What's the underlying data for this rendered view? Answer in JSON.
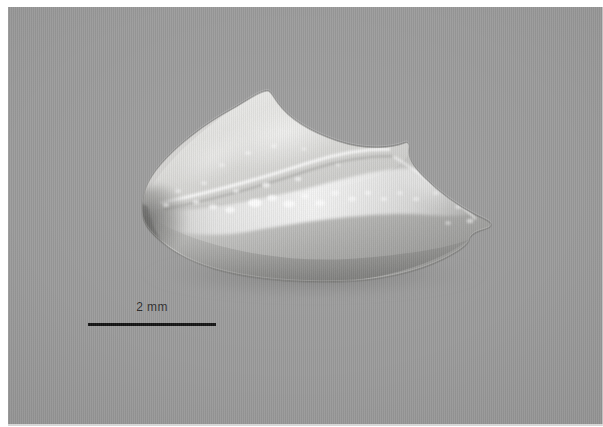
{
  "figure": {
    "kind": "macro-photograph",
    "subject_label": "translucent specimen",
    "background_color": "#9b9b9b",
    "plate_border_color": "#ffffff",
    "annotation_color": "#141414"
  },
  "scale_bar": {
    "label": "2 mm",
    "value": 2,
    "unit": "mm",
    "bar_length_px": 128,
    "position": {
      "x": 88,
      "y": 316
    }
  },
  "specimen": {
    "name": "specimen",
    "description": "elongate translucent specimen, blunt rounded left end, tapering pointed right end, raised dorsal apex, bright speckled central highlight band",
    "length_px": 348,
    "height_px": 192,
    "bounds": {
      "left": 140,
      "top": 90,
      "right": 490,
      "bottom": 282
    },
    "estimated_length_mm": 5.4,
    "estimated_height_mm": 3.0,
    "body_fill": "#c9c9c7",
    "shadow_color": "#7f7f7e",
    "highlight_color": "#f2f2f0"
  }
}
